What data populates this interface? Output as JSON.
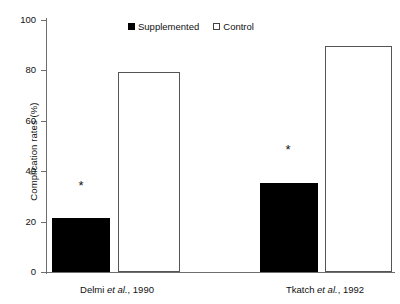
{
  "chart_data": {
    "type": "bar",
    "title": "",
    "xlabel": "",
    "ylabel": "Complication rates (%)",
    "ylim": [
      0,
      100
    ],
    "yticks": [
      0,
      20,
      40,
      60,
      80,
      100
    ],
    "ytick_labels": [
      "0",
      "20",
      "40",
      "60",
      "80",
      "100"
    ],
    "grid": false,
    "legend_position": "top-center",
    "categories": [
      "Delmi et al., 1990",
      "Tkatch et al., 1992"
    ],
    "series": [
      {
        "name": "Supplemented",
        "color": "#000000",
        "style": "filled",
        "values": [
          21.5,
          35.5
        ]
      },
      {
        "name": "Control",
        "color": "#ffffff",
        "style": "open",
        "values": [
          79.5,
          89.5
        ]
      }
    ],
    "annotations": [
      {
        "text": "*",
        "group": "Delmi et al., 1990",
        "series": "Supplemented",
        "value": 37
      },
      {
        "text": "*",
        "group": "Tkatch et al., 1992",
        "series": "Supplemented",
        "value": 51
      }
    ]
  },
  "axis": {
    "y_title": "Complication rates (%)",
    "tick_0": "0",
    "tick_20": "20",
    "tick_40": "40",
    "tick_60": "60",
    "tick_80": "80",
    "tick_100": "100"
  },
  "legend": {
    "items": [
      {
        "label": "Supplemented",
        "style": "filled"
      },
      {
        "label": "Control",
        "style": "open"
      }
    ]
  },
  "groups": [
    {
      "name_main": "Delmi ",
      "name_italic": "et al.",
      "name_tail": ", 1990"
    },
    {
      "name_main": "Tkatch ",
      "name_italic": "et al.",
      "name_tail": ", 1992"
    }
  ],
  "asterisks": {
    "mark": "*"
  }
}
